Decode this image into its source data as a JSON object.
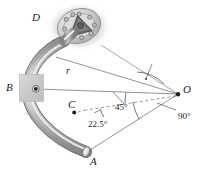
{
  "figure": {
    "type": "mechanical-engineering-diagram",
    "width": 204,
    "height": 172,
    "background": "#ffffff"
  },
  "labels": {
    "point_D": "D",
    "point_B": "B",
    "point_C": "C",
    "point_O": "O",
    "point_A": "A",
    "radius": "r",
    "angle_45": "45°",
    "angle_22_5": "22.5°",
    "angle_90": "90°"
  },
  "geometry": {
    "pivot_O": {
      "x": 178,
      "y": 94
    },
    "pin_B": {
      "x": 36,
      "y": 89
    },
    "center_C": {
      "x": 74,
      "y": 112
    },
    "bar_end_A": {
      "x": 86,
      "y": 152
    },
    "bar_top_D": {
      "x": 64,
      "y": 41
    },
    "radius_line_from": "O",
    "radius_line_to": "B"
  },
  "icons": {
    "support_block": "fixed-support-block-icon",
    "pin_joint": "pin-joint-icon",
    "flange_joint": "bolted-flange-joint-icon",
    "curved_bar": "curved-tube-bar-icon"
  },
  "colors": {
    "line": "#3a3a3a",
    "text": "#1b1b1b",
    "support_fill": "#cccccc",
    "tube_light": "#e8e8e8",
    "tube_mid": "#b6b6b6",
    "tube_dark": "#7d7d7d",
    "flange_fill": "#c9c9c9",
    "bracket_fill": "#6f6f6f"
  }
}
